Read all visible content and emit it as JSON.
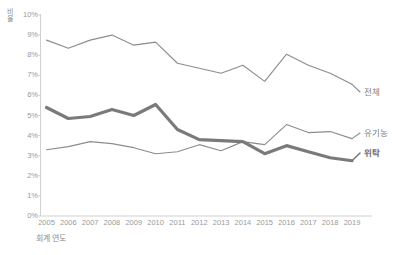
{
  "chart_data": {
    "type": "line",
    "title": "",
    "xlabel": "회계 연도",
    "ylabel": "비율",
    "categories": [
      "2005",
      "2006",
      "2007",
      "2008",
      "2009",
      "2010",
      "2011",
      "2012",
      "2013",
      "2014",
      "2015",
      "2016",
      "2017",
      "2018",
      "2019"
    ],
    "ylim": [
      0,
      10
    ],
    "ytick_labels": [
      "10%",
      "9%",
      "8%",
      "7%",
      "6%",
      "5%",
      "4%",
      "3%",
      "2%",
      "1%",
      "0%"
    ],
    "ytick_values": [
      10,
      9,
      8,
      7,
      6,
      5,
      4,
      3,
      2,
      1,
      0
    ],
    "grid": false,
    "legend_position": "right-end-labels",
    "series": [
      {
        "name": "전체",
        "color": "#8c8c8c",
        "width": 1.1,
        "bold_label": false,
        "values": [
          8.75,
          8.35,
          8.75,
          9.0,
          8.5,
          8.65,
          7.6,
          7.35,
          7.1,
          7.5,
          6.7,
          8.05,
          7.5,
          7.1,
          6.55
        ]
      },
      {
        "name": "유기농",
        "color": "#8c8c8c",
        "width": 1.1,
        "bold_label": false,
        "values": [
          3.3,
          3.45,
          3.7,
          3.6,
          3.4,
          3.1,
          3.2,
          3.55,
          3.25,
          3.7,
          3.55,
          4.55,
          4.15,
          4.2,
          3.85
        ]
      },
      {
        "name": "위탁",
        "color": "#7a7a7a",
        "width": 3.2,
        "bold_label": true,
        "values": [
          5.4,
          4.85,
          4.95,
          5.3,
          5.0,
          5.55,
          4.3,
          3.8,
          3.75,
          3.7,
          3.1,
          3.5,
          3.2,
          2.9,
          2.75
        ]
      }
    ]
  },
  "axis": {
    "axis_color": "#d0d0d0",
    "tick_color": "#d0d0d0",
    "label_color": "#9a9a9a"
  }
}
